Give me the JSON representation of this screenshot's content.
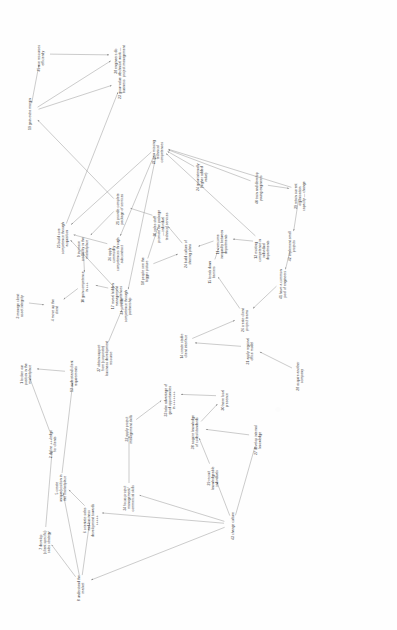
{
  "diagram": {
    "orientation": "text rotated 90 degrees counter-clockwise",
    "style": {
      "background": "#ffffff",
      "node_text_color": "#3b3b3b",
      "edge_color": "#8c8c8c"
    },
    "nodes": [
      {
        "id": "45",
        "label": "45 use resources\nefficiently",
        "x": 41,
        "y": 54,
        "w": 30
      },
      {
        "id": "38",
        "label": "38 engineers do\ntechnical work —\nproject management",
        "x": 120,
        "y": 55,
        "w": 36
      },
      {
        "id": "23",
        "label": "23 grow value of\nbusiness",
        "x": 122,
        "y": 82,
        "w": 28
      },
      {
        "id": "25",
        "label": "25 build core\ncompetence through\nacquisition",
        "x": 63,
        "y": 232,
        "w": 36
      },
      {
        "id": "36",
        "label": "36 apply\ncommodity\ncompetences through\nsubcontract",
        "x": 116,
        "y": 246,
        "w": 36
      },
      {
        "id": "44",
        "label": "44 provide\ncompetence through\npartnership",
        "x": 126,
        "y": 300,
        "w": 34
      },
      {
        "id": "37",
        "label": "37 obtain support\nfrom (corporate)\nbusiness development\nresource",
        "x": 105,
        "y": 350,
        "w": 38
      },
      {
        "id": "19",
        "label": "19 gain extra margin",
        "x": 30,
        "y": 112,
        "w": 32
      },
      {
        "id": "22",
        "label": "22 gain missing\ntechnical\ncompetences",
        "x": 158,
        "y": 146,
        "w": 30
      },
      {
        "id": "24",
        "label": "24 grow internally\n(higher added value)",
        "x": 202,
        "y": 171,
        "w": 32
      },
      {
        "id": "40",
        "label": "40 train and develop\nyoung engineers",
        "x": 259,
        "y": 184,
        "w": 32
      },
      {
        "id": "39",
        "label": "39 retain current\norganisation\ncapacity — change",
        "x": 300,
        "y": 190,
        "w": 34
      },
      {
        "id": "21",
        "label": "21 provide complete\npackage of services",
        "x": 120,
        "y": 205,
        "w": 34
      },
      {
        "id": "20",
        "label": "20 sales staff\npromote the package\n— individual\ntechnical services",
        "x": 161,
        "y": 218,
        "w": 36
      },
      {
        "id": "11",
        "label": "11 overcome\ninequality between\ndepartments",
        "x": 222,
        "y": 238,
        "w": 32
      },
      {
        "id": "12",
        "label": "12 existing\ncompetence in\nindividual\ndepartments",
        "x": 262,
        "y": 242,
        "w": 34
      },
      {
        "id": "42",
        "label": "42 implement small\nprojects",
        "x": 292,
        "y": 242,
        "w": 32
      },
      {
        "id": "9",
        "label": "9 increase\ncredibility in the\nmarketplace",
        "x": 83,
        "y": 243,
        "w": 30
      },
      {
        "id": "24b",
        "label": "24 build culture of\nsharing plans",
        "x": 188,
        "y": 250,
        "w": 30
      },
      {
        "id": "18",
        "label": "18 people see the\nbigger picture",
        "x": 145,
        "y": 267,
        "w": 30
      },
      {
        "id": "15",
        "label": "15 break down\nbarriers",
        "x": 212,
        "y": 268,
        "w": 28
      },
      {
        "id": "41",
        "label": "41 have a common\npool of engineers",
        "x": 283,
        "y": 280,
        "w": 32
      },
      {
        "id": "10",
        "label": "10 gain competence\nin +++",
        "x": 85,
        "y": 283,
        "w": 32
      },
      {
        "id": "17",
        "label": "17 reveal hidden\nmanagement\ncompetences",
        "x": 117,
        "y": 290,
        "w": 32
      },
      {
        "id": "3",
        "label": "3 manage client\nasset integrity",
        "x": 20,
        "y": 302,
        "w": 28
      },
      {
        "id": "4",
        "label": "4 move up the\nclient",
        "x": 55,
        "y": 306,
        "w": 26
      },
      {
        "id": "26",
        "label": "26 create client\nproject teams",
        "x": 245,
        "y": 316,
        "w": 28
      },
      {
        "id": "14",
        "label": "14 create stable\nclient interface",
        "x": 184,
        "y": 342,
        "w": 30
      },
      {
        "id": "31",
        "label": "31 apply regional\noffice model",
        "x": 250,
        "y": 347,
        "w": 30
      },
      {
        "id": "1",
        "label": "1 broker our\nposition in the\nmarketplace",
        "x": 26,
        "y": 368,
        "w": 30
      },
      {
        "id": "13",
        "label": "13 understand client\nrequirements",
        "x": 74,
        "y": 372,
        "w": 32
      },
      {
        "id": "28",
        "label": "28 acquire another\ncompany",
        "x": 300,
        "y": 372,
        "w": 32
      },
      {
        "id": "33",
        "label": "33 take advantage of\ngood opportunities\nin +++++++",
        "x": 170,
        "y": 394,
        "w": 36
      },
      {
        "id": "30",
        "label": "30 have local\npresence",
        "x": 225,
        "y": 396,
        "w": 28
      },
      {
        "id": "32",
        "label": "32 apply project\nmanagement skills",
        "x": 129,
        "y": 425,
        "w": 32
      },
      {
        "id": "38b",
        "label": "38 acquire knowledge\nof codes/standards",
        "x": 195,
        "y": 428,
        "w": 34
      },
      {
        "id": "27",
        "label": "27 develop internal\nknowledge",
        "x": 258,
        "y": 436,
        "w": 32
      },
      {
        "id": "2",
        "label": "2 define +++ledge\nfor clients",
        "x": 53,
        "y": 440,
        "w": 30
      },
      {
        "id": "29",
        "label": "29 recruit\nknowledgeable\nindividuals",
        "x": 213,
        "y": 472,
        "w": 30
      },
      {
        "id": "5",
        "label": "5 create\nunique/position in\nthe marketplace",
        "x": 61,
        "y": 482,
        "w": 32
      },
      {
        "id": "34",
        "label": "34 focus project\nmanagement/\ncommercial skills",
        "x": 129,
        "y": 492,
        "w": 32
      },
      {
        "id": "6",
        "label": "6 orientate sales\nand business\ndevelopment towards\n+++++",
        "x": 91,
        "y": 512,
        "w": 36
      },
      {
        "id": "43",
        "label": "43 change culture",
        "x": 233,
        "y": 524,
        "w": 30
      },
      {
        "id": "7",
        "label": "7 develop\n(client specific)\nsales strategy",
        "x": 45,
        "y": 536,
        "w": 32
      },
      {
        "id": "8",
        "label": "8 understand the\nmarket",
        "x": 81,
        "y": 584,
        "w": 30
      }
    ],
    "edges": [
      {
        "from": "19",
        "to": "45"
      },
      {
        "from": "19",
        "to": "38"
      },
      {
        "from": "45",
        "to": "38"
      },
      {
        "from": "19",
        "to": "23"
      },
      {
        "from": "21",
        "to": "19"
      },
      {
        "from": "25",
        "to": "23"
      },
      {
        "from": "36",
        "to": "25"
      },
      {
        "from": "44",
        "to": "25"
      },
      {
        "from": "22",
        "to": "25"
      },
      {
        "from": "22",
        "to": "36"
      },
      {
        "from": "22",
        "to": "44"
      },
      {
        "from": "37",
        "to": "44"
      },
      {
        "from": "24",
        "to": "22"
      },
      {
        "from": "40",
        "to": "22"
      },
      {
        "from": "39",
        "to": "22"
      },
      {
        "from": "12",
        "to": "22"
      },
      {
        "from": "21",
        "to": "9"
      },
      {
        "from": "20",
        "to": "21"
      },
      {
        "from": "24b",
        "to": "20"
      },
      {
        "from": "18",
        "to": "20"
      },
      {
        "from": "9",
        "to": "10"
      },
      {
        "from": "17",
        "to": "10"
      },
      {
        "from": "10",
        "to": "4"
      },
      {
        "from": "3",
        "to": "4"
      },
      {
        "from": "11",
        "to": "24b"
      },
      {
        "from": "12",
        "to": "11"
      },
      {
        "from": "15",
        "to": "11"
      },
      {
        "from": "18",
        "to": "24b"
      },
      {
        "from": "26",
        "to": "15"
      },
      {
        "from": "41",
        "to": "26"
      },
      {
        "from": "42",
        "to": "41"
      },
      {
        "from": "39",
        "to": "42"
      },
      {
        "from": "40",
        "to": "39"
      },
      {
        "from": "14",
        "to": "26"
      },
      {
        "from": "31",
        "to": "14"
      },
      {
        "from": "28",
        "to": "31"
      },
      {
        "from": "30",
        "to": "33"
      },
      {
        "from": "38b",
        "to": "30"
      },
      {
        "from": "27",
        "to": "38b"
      },
      {
        "from": "29",
        "to": "38b"
      },
      {
        "from": "43",
        "to": "29"
      },
      {
        "from": "43",
        "to": "27"
      },
      {
        "from": "43",
        "to": "34"
      },
      {
        "from": "43",
        "to": "6"
      },
      {
        "from": "43",
        "to": "8"
      },
      {
        "from": "8",
        "to": "6"
      },
      {
        "from": "8",
        "to": "5"
      },
      {
        "from": "8",
        "to": "7"
      },
      {
        "from": "6",
        "to": "5"
      },
      {
        "from": "7",
        "to": "2"
      },
      {
        "from": "5",
        "to": "13"
      },
      {
        "from": "13",
        "to": "1"
      },
      {
        "from": "2",
        "to": "1"
      },
      {
        "from": "32",
        "to": "33"
      },
      {
        "from": "34",
        "to": "32"
      }
    ]
  }
}
